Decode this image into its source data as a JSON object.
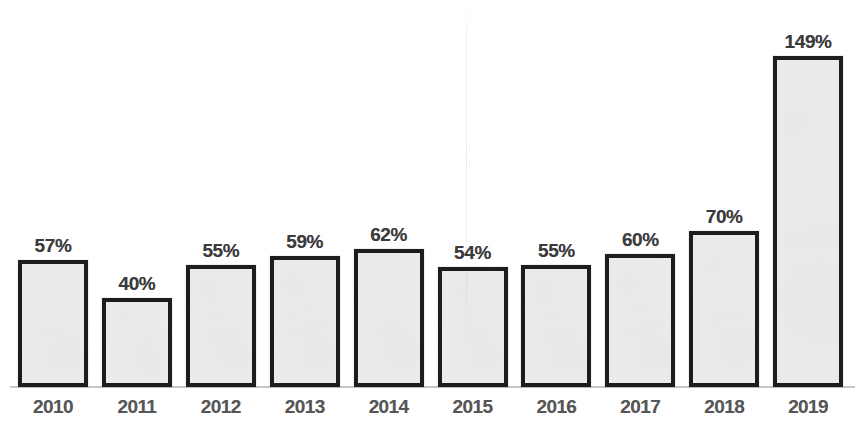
{
  "chart_data": {
    "type": "bar",
    "title": "",
    "xlabel": "",
    "ylabel": "",
    "ylim": [
      0,
      160
    ],
    "grid": false,
    "legend": "none",
    "categories": [
      "2010",
      "2011",
      "2012",
      "2013",
      "2014",
      "2015",
      "2016",
      "2017",
      "2018",
      "2019"
    ],
    "values": [
      57,
      40,
      55,
      59,
      62,
      54,
      55,
      60,
      70,
      149
    ],
    "data_labels": [
      "57%",
      "40%",
      "55%",
      "59%",
      "62%",
      "54%",
      "55%",
      "60%",
      "70%",
      "149%"
    ],
    "series": [
      {
        "name": "",
        "values": [
          57,
          40,
          55,
          59,
          62,
          54,
          55,
          60,
          70,
          149
        ]
      }
    ],
    "units": "percent",
    "colors": {
      "bar_fill": "#ececec",
      "bar_outline": "#1d1d1d",
      "data_label": "#3c3c3c",
      "category_label": "#575757",
      "axis_line": "#c6c6c6",
      "background": "#ffffff"
    }
  },
  "bars": [
    {
      "category": "2010",
      "label": "57%",
      "value": 57
    },
    {
      "category": "2011",
      "label": "40%",
      "value": 40
    },
    {
      "category": "2012",
      "label": "55%",
      "value": 55
    },
    {
      "category": "2013",
      "label": "59%",
      "value": 59
    },
    {
      "category": "2014",
      "label": "62%",
      "value": 62
    },
    {
      "category": "2015",
      "label": "54%",
      "value": 54
    },
    {
      "category": "2016",
      "label": "55%",
      "value": 55
    },
    {
      "category": "2017",
      "label": "60%",
      "value": 60
    },
    {
      "category": "2018",
      "label": "70%",
      "value": 70
    },
    {
      "category": "2019",
      "label": "149%",
      "value": 149
    }
  ]
}
